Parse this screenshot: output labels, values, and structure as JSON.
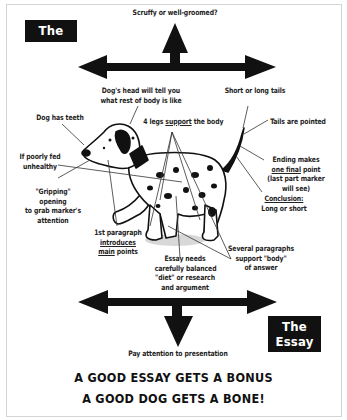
{
  "titles": {
    "dog": "The Dog",
    "essay_line1": "The",
    "essay_line2": "Essay"
  },
  "arrows": {
    "top_up_label": "Scruffy or well-groomed?",
    "bottom_down_label": "Pay attention to presentation"
  },
  "labels": {
    "dog_head": [
      "Dog's head will tell you",
      "what rest of body is like"
    ],
    "short_long_tails": "Short or long tails",
    "dog_teeth": "Dog has teeth",
    "four_legs_pre": "4 legs ",
    "four_legs_underlined": "support",
    "four_legs_post": " the body",
    "tails_pointed": "Tails are pointed",
    "poorly_fed": [
      "If poorly fed",
      "unhealthy"
    ],
    "ending_line1": "Ending makes",
    "ending_line2_underlined": "one final",
    "ending_line2_post": " point",
    "ending_line3": "(last part marker",
    "ending_line4": "will see)",
    "conclusion_underlined": "Conclusion:",
    "conclusion_line2": "Long or short",
    "gripping": [
      "\"Gripping\"",
      "opening",
      "to grab marker's",
      "attention"
    ],
    "first_para_line1": "1st paragraph",
    "first_para_line2_underlined": "introduces",
    "first_para_line3_underlined": "main",
    "first_para_line3_post": " points",
    "several_paras": [
      "Several paragraphs",
      "support \"body\"",
      "of answer"
    ],
    "essay_needs": [
      "Essay needs",
      "carefully balanced",
      "\"diet\" or research",
      "and argument"
    ]
  },
  "footer": {
    "line1": "A GOOD ESSAY GETS A BONUS",
    "line2": "A GOOD DOG GETS A BONE!"
  },
  "colors": {
    "ink": "#111111",
    "frame": "#d4d4d4",
    "shadow": "#d8d8d8",
    "background": "#ffffff"
  }
}
